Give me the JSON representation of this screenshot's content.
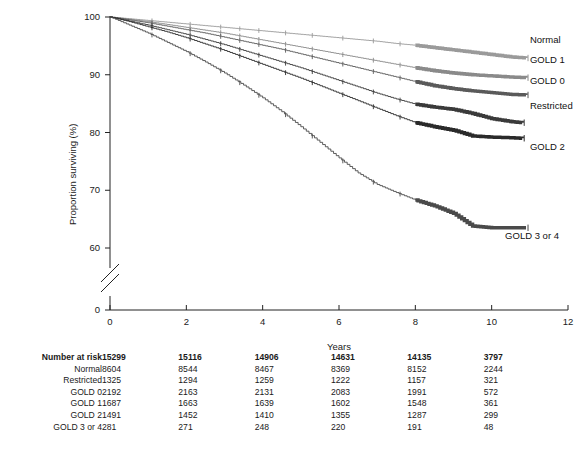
{
  "chart_data": {
    "type": "line",
    "title": "",
    "subtitle": "",
    "xlabel": "Years",
    "ylabel": "Proportion surviving (%)",
    "xlim": [
      0,
      12
    ],
    "ylim": [
      58,
      100
    ],
    "yaxis_break": true,
    "yaxis_break_note": "axis broken between 60 and 0",
    "xticks": [
      0,
      2,
      4,
      6,
      8,
      10,
      12
    ],
    "xtick_labels": [
      "0",
      "2",
      "4",
      "6",
      "8",
      "10",
      "12"
    ],
    "yticks": [
      100,
      90,
      80,
      70,
      60,
      0
    ],
    "ytick_labels": [
      "100",
      "90",
      "80",
      "70",
      "60",
      "0"
    ],
    "grid": false,
    "legend_position": "right-of-curve-ends",
    "censor_marks": true,
    "series": [
      {
        "name": "Normal",
        "color": "#9a9a9a",
        "label": "Normal",
        "label_x": 10.95,
        "label_y": 96.1,
        "x": [
          0,
          0.5,
          1,
          1.5,
          2,
          2.5,
          3,
          3.5,
          4,
          4.5,
          5,
          5.5,
          6,
          6.5,
          7,
          7.5,
          8,
          8.5,
          9,
          9.5,
          10,
          10.5,
          10.9
        ],
        "y": [
          100,
          99.7,
          99.4,
          99.1,
          98.8,
          98.5,
          98.2,
          97.9,
          97.6,
          97.3,
          97.0,
          96.7,
          96.4,
          96.1,
          95.8,
          95.4,
          95.1,
          94.7,
          94.3,
          93.9,
          93.5,
          93.1,
          92.9
        ]
      },
      {
        "name": "GOLD 1",
        "color": "#8a8a8a",
        "label": "GOLD 1",
        "label_x": 10.95,
        "label_y": 92.6,
        "x": [
          0,
          0.5,
          1,
          1.5,
          2,
          2.5,
          3,
          3.5,
          4,
          4.5,
          5,
          5.5,
          6,
          6.5,
          7,
          7.5,
          8,
          8.5,
          9,
          9.5,
          10,
          10.5,
          10.9
        ],
        "y": [
          100,
          99.6,
          99.2,
          98.7,
          98.2,
          97.7,
          97.2,
          96.6,
          96.0,
          95.4,
          94.8,
          94.2,
          93.6,
          93.0,
          92.4,
          91.8,
          91.2,
          90.7,
          90.3,
          90.0,
          89.8,
          89.6,
          89.5
        ]
      },
      {
        "name": "GOLD 0",
        "color": "#5a5a5a",
        "label": "GOLD 0",
        "label_x": 10.95,
        "label_y": 88.9,
        "x": [
          0,
          0.5,
          1,
          1.5,
          2,
          2.5,
          3,
          3.5,
          4,
          4.5,
          5,
          5.5,
          6,
          6.5,
          7,
          7.5,
          8,
          8.5,
          9,
          9.5,
          10,
          10.5,
          10.9
        ],
        "y": [
          100,
          99.5,
          99.0,
          98.4,
          97.8,
          97.2,
          96.5,
          95.8,
          95.1,
          94.4,
          93.6,
          92.8,
          92.0,
          91.2,
          90.4,
          89.6,
          88.8,
          88.1,
          87.6,
          87.2,
          86.9,
          86.6,
          86.5
        ]
      },
      {
        "name": "Restricted",
        "color": "#3a3a3a",
        "label": "Restricted",
        "label_x": 10.95,
        "label_y": 84.6,
        "x": [
          0,
          0.5,
          1,
          1.5,
          2,
          2.5,
          3,
          3.5,
          4,
          4.5,
          5,
          5.5,
          6,
          6.5,
          7,
          7.5,
          8,
          8.5,
          9,
          9.5,
          10,
          10.5,
          10.8
        ],
        "y": [
          100,
          99.3,
          98.6,
          97.8,
          97.0,
          96.1,
          95.2,
          94.2,
          93.2,
          92.2,
          91.2,
          90.1,
          89.0,
          87.9,
          86.8,
          85.8,
          84.9,
          84.4,
          84.0,
          83.3,
          82.4,
          81.9,
          81.7
        ]
      },
      {
        "name": "GOLD 2",
        "color": "#2a2a2a",
        "label": "GOLD 2",
        "label_x": 10.95,
        "label_y": 77.5,
        "x": [
          0,
          0.5,
          1,
          1.5,
          2,
          2.5,
          3,
          3.5,
          4,
          4.5,
          5,
          5.5,
          6,
          6.5,
          7,
          7.5,
          8,
          8.5,
          9,
          9.5,
          10,
          10.5,
          10.8
        ],
        "y": [
          100,
          99.2,
          98.3,
          97.4,
          96.4,
          95.3,
          94.2,
          93.0,
          91.8,
          90.6,
          89.4,
          88.1,
          86.8,
          85.5,
          84.2,
          82.9,
          81.7,
          81.0,
          80.4,
          79.4,
          79.2,
          79.1,
          79.0
        ]
      },
      {
        "name": "GOLD 3 or 4",
        "color": "#4a4a4a",
        "label": "GOLD 3 or 4",
        "label_x": 10.3,
        "label_y": 62.0,
        "x": [
          0,
          0.5,
          1,
          1.5,
          2,
          2.5,
          3,
          3.5,
          4,
          4.5,
          5,
          5.5,
          6,
          6.5,
          7,
          7.5,
          8,
          8.5,
          9,
          9.5,
          10,
          10.5,
          10.9
        ],
        "y": [
          100,
          98.6,
          97.2,
          95.6,
          94.0,
          92.2,
          90.3,
          88.2,
          86.0,
          83.6,
          81.0,
          78.3,
          75.6,
          73.0,
          71.0,
          69.6,
          68.3,
          67.3,
          66.0,
          63.8,
          63.5,
          63.5,
          63.5
        ]
      }
    ]
  },
  "risk_table": {
    "header_label": "Number at risk",
    "columns_at_years": [
      0,
      2,
      4,
      6,
      8,
      10
    ],
    "rows": [
      {
        "label": "Number at risk",
        "bold": true,
        "values": [
          "15299",
          "15116",
          "14906",
          "14631",
          "14135",
          "3797"
        ]
      },
      {
        "label": "Normal",
        "bold": false,
        "values": [
          "8604",
          "8544",
          "8467",
          "8369",
          "8152",
          "2244"
        ]
      },
      {
        "label": "Restricted",
        "bold": false,
        "values": [
          "1325",
          "1294",
          "1259",
          "1222",
          "1157",
          "321"
        ]
      },
      {
        "label": "GOLD 0",
        "bold": false,
        "values": [
          "2192",
          "2163",
          "2131",
          "2083",
          "1991",
          "572"
        ]
      },
      {
        "label": "GOLD 1",
        "bold": false,
        "values": [
          "1687",
          "1663",
          "1639",
          "1602",
          "1548",
          "361"
        ]
      },
      {
        "label": "GOLD 2",
        "bold": false,
        "values": [
          "1491",
          "1452",
          "1410",
          "1355",
          "1287",
          "299"
        ]
      },
      {
        "label": "GOLD 3 or 4",
        "bold": false,
        "values": [
          "281",
          "271",
          "248",
          "220",
          "191",
          "48"
        ]
      }
    ]
  },
  "axis": {
    "x_title": "Years",
    "y_title": "Proportion surviving (%)"
  }
}
